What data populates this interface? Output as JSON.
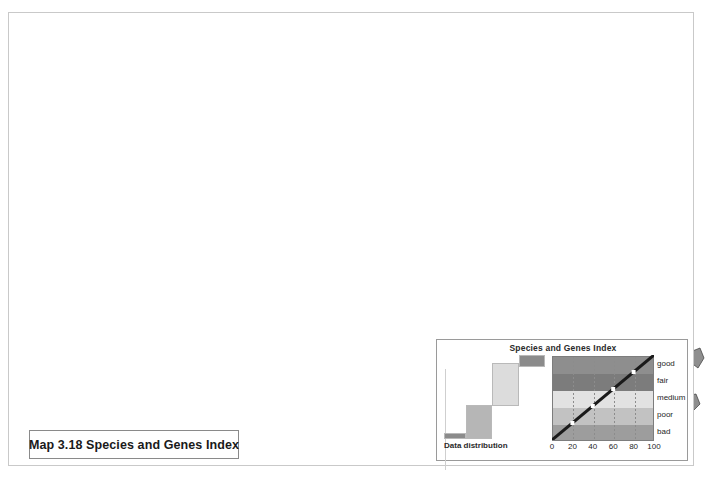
{
  "title_box": {
    "text": "Map 3.18 Species and Genes Index"
  },
  "legend": {
    "title": "Species and Genes Index",
    "distribution_label": "Data distribution",
    "class_labels": [
      "good",
      "fair",
      "medium",
      "poor",
      "bad"
    ],
    "axis_ticks": [
      "0",
      "20",
      "40",
      "60",
      "80",
      "100"
    ],
    "axis_min": 0,
    "axis_max": 100,
    "marker_values": [
      20,
      40,
      60,
      80
    ]
  },
  "chart_data": {
    "type": "map",
    "title": "Map 3.18 Species and Genes Index",
    "subtitle": "Species and Genes Index",
    "projection": "world-pacific-centered",
    "scheme": "greyscale-5-class",
    "classes": [
      {
        "label": "good",
        "range": [
          80,
          100
        ],
        "color": "#8e8e8e"
      },
      {
        "label": "fair",
        "range": [
          60,
          80
        ],
        "color": "#7c7c7c"
      },
      {
        "label": "medium",
        "range": [
          40,
          60
        ],
        "color": "#e2e2e2"
      },
      {
        "label": "poor",
        "range": [
          20,
          40
        ],
        "color": "#c2c2c2"
      },
      {
        "label": "bad",
        "range": [
          0,
          20
        ],
        "color": "#9d9d9d"
      }
    ],
    "distribution_steps": [
      {
        "class": "bad",
        "color": "#8b8b8b",
        "x": 0,
        "w": 22,
        "y": 78,
        "h": 6
      },
      {
        "class": "poor",
        "color": "#b6b6b6",
        "x": 22,
        "w": 26,
        "y": 50,
        "h": 34
      },
      {
        "class": "medium",
        "color": "#dcdcdc",
        "x": 48,
        "w": 27,
        "y": 8,
        "h": 43
      },
      {
        "class": "good",
        "color": "#8b8b8b",
        "x": 75,
        "w": 26,
        "y": 0,
        "h": 12
      }
    ],
    "xlabel": "",
    "ylabel": "",
    "grid": true,
    "legend_position": "bottom-right"
  },
  "colors": {
    "good": "#8e8e8e",
    "fair": "#7c7c7c",
    "medium": "#e2e2e2",
    "poor": "#c2c2c2",
    "bad": "#9d9d9d",
    "ocean": "#ffffff",
    "outline": "#3a3a3a",
    "frame": "#c9c9c9"
  }
}
